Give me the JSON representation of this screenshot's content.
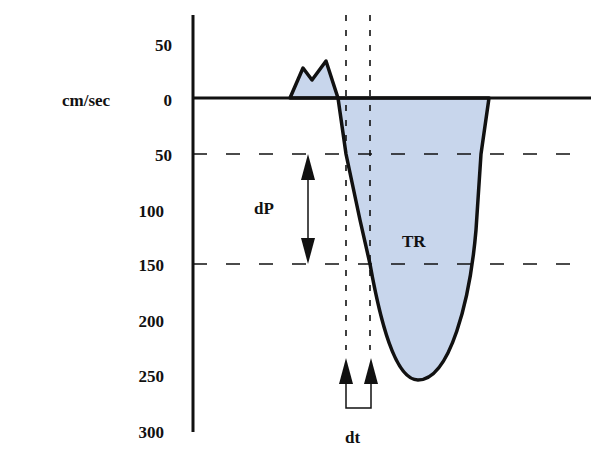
{
  "diagram": {
    "title": "",
    "y_unit_label": "cm/sec",
    "y_ticks": [
      {
        "label": "50",
        "y": 44
      },
      {
        "label": "0",
        "y": 98
      },
      {
        "label": "50",
        "y": 154
      },
      {
        "label": "100",
        "y": 210
      },
      {
        "label": "150",
        "y": 264
      },
      {
        "label": "200",
        "y": 320
      },
      {
        "label": "250",
        "y": 375
      },
      {
        "label": "300",
        "y": 430
      }
    ],
    "annotations": {
      "dP": "dP",
      "dt": "dt",
      "TR": "TR"
    },
    "colors": {
      "fill": "#c8d6ec",
      "stroke": "#111111",
      "background": "#ffffff"
    },
    "reference_lines": {
      "dashed_horizontal_velocities": [
        50,
        150
      ],
      "dotted_vertical": [
        "t1",
        "t2"
      ]
    }
  }
}
